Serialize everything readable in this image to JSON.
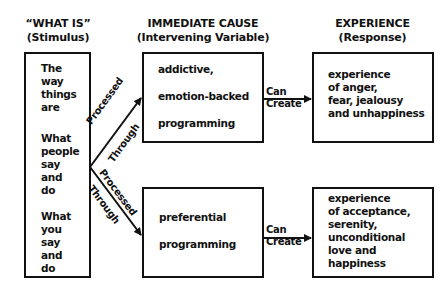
{
  "columns": [
    {
      "title": "“WHAT IS”",
      "subtitle": "(Stimulus)"
    },
    {
      "title": "IMMEDIATE CAUSE",
      "subtitle": "(Intervening Variable)"
    },
    {
      "title": "EXPERIENCE",
      "subtitle": "(Response)"
    }
  ],
  "stimulus": {
    "groups": [
      [
        "The",
        "way",
        "things",
        "are"
      ],
      [
        "What",
        "people",
        "say",
        "and",
        "do"
      ],
      [
        "What",
        "you",
        "say",
        "and",
        "do"
      ]
    ]
  },
  "paths": [
    {
      "connector_label": [
        "Processed",
        "Through"
      ],
      "cause": [
        "addictive,",
        "emotion-backed",
        "programming"
      ],
      "arrow_label": [
        "Can",
        "Create"
      ],
      "experience": [
        "experience",
        "of anger,",
        "fear, jealousy",
        "and unhappiness"
      ]
    },
    {
      "connector_label": [
        "Processed",
        "Through"
      ],
      "cause": [
        "preferential",
        "programming"
      ],
      "arrow_label": [
        "Can",
        "Create"
      ],
      "experience": [
        "experience",
        "of acceptance,",
        "serenity,",
        "unconditional",
        "love and",
        "happiness"
      ]
    }
  ],
  "colors": {
    "line": "#111111",
    "background": "#ffffff"
  }
}
